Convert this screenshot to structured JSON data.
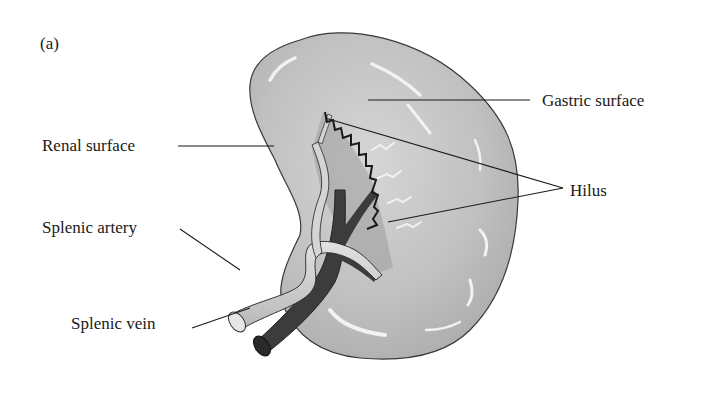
{
  "figure": {
    "panel_label": "(a)",
    "labels": {
      "gastric_surface": "Gastric surface",
      "renal_surface": "Renal surface",
      "hilus": "Hilus",
      "splenic_artery": "Splenic artery",
      "splenic_vein": "Splenic vein"
    },
    "colors": {
      "organ_fill": "#c4c4c4",
      "organ_outline": "#3a3a3a",
      "artery_fill": "#cfcfcf",
      "vein_fill": "#3c3c3c",
      "leader_line": "#1a1a1a",
      "background": "#ffffff"
    }
  }
}
